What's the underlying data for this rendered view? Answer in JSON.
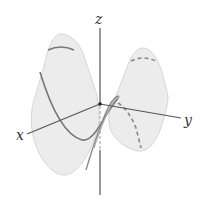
{
  "figure": {
    "axes": {
      "x_label": "x",
      "y_label": "y",
      "z_label": "z"
    },
    "colors": {
      "surface_fill": "#ececec",
      "surface_edge": "#d4d4d4",
      "axis": "#555555",
      "trace": "#777777",
      "dashed_trace": "#888888"
    }
  }
}
